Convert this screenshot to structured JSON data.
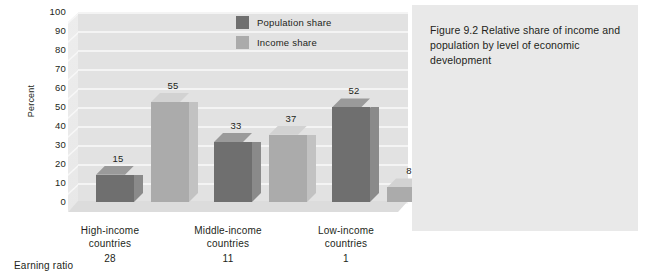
{
  "chart_data": {
    "type": "bar",
    "title": "",
    "xlabel": "",
    "ylabel": "Percent",
    "ylim": [
      0,
      100
    ],
    "ytick_step": 10,
    "grid": true,
    "legend_position": "top-right",
    "categories": [
      "High-income countries",
      "Middle-income countries",
      "Low-income countries"
    ],
    "yticks": [
      "100",
      "90",
      "80",
      "70",
      "60",
      "50",
      "40",
      "30",
      "20",
      "10",
      "0"
    ],
    "series": [
      {
        "name": "Population share",
        "values": [
          15,
          33,
          52
        ],
        "color": "#6f6f6f"
      },
      {
        "name": "Income share",
        "values": [
          55,
          37,
          8
        ],
        "color": "#ababab"
      }
    ],
    "annotations": {
      "earning_ratio_label": "Earning ratio",
      "earning_ratios": [
        "28",
        "11",
        "1"
      ]
    }
  },
  "legend": {
    "items": [
      {
        "label": "Population share",
        "color": "#6f6f6f"
      },
      {
        "label": "Income share",
        "color": "#ababab"
      }
    ]
  },
  "axis": {
    "y_title": "Percent",
    "ticks": [
      "100",
      "90",
      "80",
      "70",
      "60",
      "50",
      "40",
      "30",
      "20",
      "10",
      "0"
    ]
  },
  "groups": [
    {
      "line1": "High-income",
      "line2": "countries",
      "ratio": "28",
      "pop": "15",
      "inc": "55"
    },
    {
      "line1": "Middle-income",
      "line2": "countries",
      "ratio": "33",
      "pop": "33",
      "inc": "37"
    },
    {
      "line1": "Low-income",
      "line2": "countries",
      "ratio": "1",
      "pop": "52",
      "inc": "8"
    }
  ],
  "group_ratios": [
    "28",
    "11",
    "1"
  ],
  "earning_ratio_label": "Earning ratio",
  "caption": {
    "figure_number": "Figure 9.2",
    "text": "Relative share of income and population by level of economic development",
    "full": "Figure 9.2  Relative share of income and population by level of economic development"
  },
  "colors": {
    "population": "#6f6f6f",
    "income": "#ababab",
    "plot_background": "#e2e2e2",
    "caption_background": "#e9e9e9",
    "text": "#231f20"
  }
}
